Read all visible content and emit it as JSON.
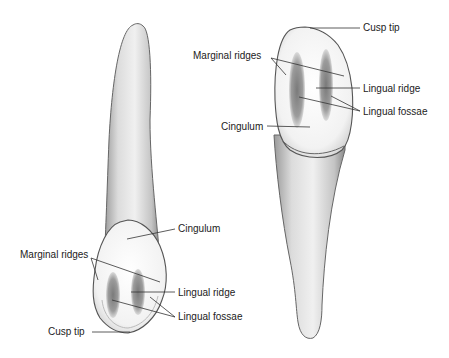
{
  "figure": {
    "left_tooth": {
      "labels": {
        "cingulum": "Cingulum",
        "marginal_ridges": "Marginal ridges",
        "lingual_ridge": "Lingual ridge",
        "lingual_fossae": "Lingual fossae",
        "cusp_tip": "Cusp tip"
      }
    },
    "right_tooth": {
      "labels": {
        "cusp_tip": "Cusp tip",
        "marginal_ridges": "Marginal ridges",
        "lingual_ridge": "Lingual ridge",
        "lingual_fossae": "Lingual fossae",
        "cingulum": "Cingulum"
      }
    }
  },
  "colors": {
    "outline": "#555555",
    "enamel": "#f4f4f4",
    "root": "#d8d8d8",
    "fossa": "#8c8c8c",
    "leader": "#333333"
  }
}
